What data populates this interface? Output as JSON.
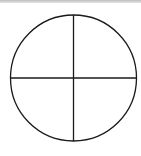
{
  "diagram": {
    "shape": "circle-divided-into-quadrants",
    "stroke_color": "#1a1a1a",
    "background_color": "#ffffff",
    "top_border_color": "#c0c0c0",
    "circle": {
      "cx": 73.5,
      "cy": 78,
      "r": 63
    },
    "lines": [
      {
        "name": "horizontal-diameter",
        "x1": 10.5,
        "y1": 78,
        "x2": 136.5,
        "y2": 78
      },
      {
        "name": "vertical-diameter",
        "x1": 73.5,
        "y1": 15,
        "x2": 73.5,
        "y2": 141
      }
    ]
  }
}
